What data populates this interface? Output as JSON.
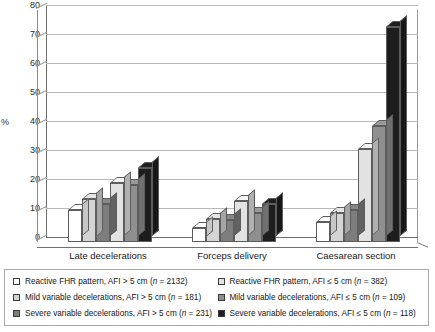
{
  "chart_data": {
    "type": "bar",
    "title": "",
    "xlabel": "",
    "ylabel": "%",
    "ylim": [
      0,
      80
    ],
    "yticks": [
      0,
      10,
      20,
      30,
      40,
      50,
      60,
      70,
      80
    ],
    "grid": true,
    "legend_position": "bottom",
    "categories": [
      "Late decelerations",
      "Forceps delivery",
      "Caesarean section"
    ],
    "series": [
      {
        "name": "Reactive FHR pattern, AFI > 5 cm (n = 2132)",
        "color": "#ffffff",
        "values": [
          11,
          5,
          7
        ]
      },
      {
        "name": "Mild variable decelerations, AFI > 5 cm (n = 181)",
        "color": "#d4d4d4",
        "values": [
          15,
          8,
          10
        ]
      },
      {
        "name": "Severe variable decelerations, AFI > 5 cm (n = 231)",
        "color": "#7d7d7d",
        "values": [
          13,
          7.5,
          11
        ]
      },
      {
        "name": "Reactive FHR pattern, AFI ≤ 5 cm (n = 382)",
        "color": "#e2e2e2",
        "values": [
          20.5,
          14,
          32
        ]
      },
      {
        "name": "Mild variable decelerations, AFI ≤ 5 cm (n = 109)",
        "color": "#8f8f8f",
        "values": [
          19.5,
          10,
          40
        ]
      },
      {
        "name": "Severe variable decelerations, AFI ≤ 5 cm (n = 118)",
        "color": "#1d1d1d",
        "values": [
          25.5,
          13,
          74
        ]
      }
    ]
  },
  "axis": {
    "y_label": "%",
    "ticks": [
      "80",
      "70",
      "60",
      "50",
      "40",
      "30",
      "20",
      "10",
      "0"
    ]
  },
  "groups": [
    {
      "label": "Late decelerations"
    },
    {
      "label": "Forceps delivery"
    },
    {
      "label": "Caesarean section"
    }
  ],
  "legend": {
    "left_column": [
      {
        "swatch": "#ffffff",
        "text": "Reactive FHR pattern, AFI > 5 cm (n = 2132)"
      },
      {
        "swatch": "#d4d4d4",
        "text": "Mild variable decelerations, AFI > 5 cm (n = 181)"
      },
      {
        "swatch": "#7d7d7d",
        "text": "Severe variable decelerations, AFI > 5 cm (n = 231)"
      }
    ],
    "right_column": [
      {
        "swatch": "#e2e2e2",
        "text": "Reactive FHR pattern, AFI ≤ 5 cm (n = 382)"
      },
      {
        "swatch": "#8f8f8f",
        "text": "Mild variable decelerations, AFI ≤ 5 cm (n = 109)"
      },
      {
        "swatch": "#1d1d1d",
        "text": "Severe variable decelerations, AFI ≤ 5 cm (n = 118)"
      }
    ]
  }
}
